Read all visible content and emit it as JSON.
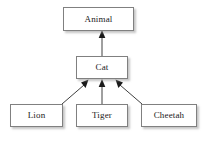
{
  "diagram": {
    "type": "class-inheritance-hierarchy",
    "background_color": "#ffffff",
    "box_border_color": "#808080",
    "box_fill_color": "#ffffff",
    "text_color": "#1a1a1a",
    "edge_color": "#404040",
    "nodes": [
      {
        "id": "animal",
        "label": "Animal",
        "level": 0
      },
      {
        "id": "cat",
        "label": "Cat",
        "level": 1
      },
      {
        "id": "lion",
        "label": "Lion",
        "level": 2
      },
      {
        "id": "tiger",
        "label": "Tiger",
        "level": 2
      },
      {
        "id": "cheetah",
        "label": "Cheetah",
        "level": 2
      }
    ],
    "edges": [
      {
        "from": "cat",
        "to": "animal",
        "arrowhead": "filled-triangle",
        "direction": "up"
      },
      {
        "from": "lion",
        "to": "cat",
        "arrowhead": "filled-triangle",
        "direction": "up-right"
      },
      {
        "from": "tiger",
        "to": "cat",
        "arrowhead": "filled-triangle",
        "direction": "up"
      },
      {
        "from": "cheetah",
        "to": "cat",
        "arrowhead": "filled-triangle",
        "direction": "up-left"
      }
    ]
  }
}
